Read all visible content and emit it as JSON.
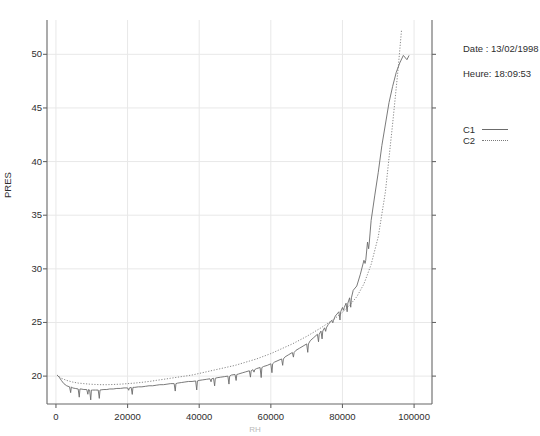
{
  "info": {
    "date_line": "Date : 13/02/1998",
    "time_line": "Heure: 18:09:53"
  },
  "legend": {
    "position": "right",
    "entries": [
      {
        "label": "C1",
        "style": "solid"
      },
      {
        "label": "C2",
        "style": "dotted"
      }
    ]
  },
  "chart_data": {
    "type": "line",
    "title": "",
    "xlabel": "RH",
    "ylabel": "PRES",
    "xlim": [
      -2500,
      105000
    ],
    "ylim": [
      17.4,
      53.2
    ],
    "grid": true,
    "xticks": [
      0,
      20000,
      40000,
      60000,
      80000,
      100000
    ],
    "xtick_labels": [
      "0",
      "20000",
      "40000",
      "60000",
      "80000",
      "100000"
    ],
    "yticks": [
      20,
      25,
      30,
      35,
      40,
      45,
      50
    ],
    "ytick_labels": [
      "20",
      "25",
      "30",
      "35",
      "40",
      "45",
      "50"
    ],
    "series": [
      {
        "name": "C1",
        "style": "solid",
        "color": "#6b6b6b",
        "description": "Noisy stepped trace with frequent downward spikes; starts near 20, dips to ~18.7, slowly climbs, then rises steeply after 85000 ending near 50.",
        "x": [
          300,
          900,
          1500,
          2200,
          3000,
          3800,
          4600,
          5400,
          6200,
          7000,
          7800,
          8600,
          9400,
          10200,
          11000,
          11800,
          12600,
          13400,
          14200,
          15000,
          16000,
          17000,
          18000,
          19000,
          20000,
          21000,
          22000,
          23000,
          24000,
          25000,
          26000,
          27000,
          28000,
          29000,
          30000,
          31000,
          32000,
          33000,
          34000,
          35000,
          36000,
          37000,
          38000,
          39000,
          40000,
          41000,
          42000,
          43000,
          44000,
          45000,
          46000,
          47000,
          48000,
          49000,
          50000,
          51000,
          52000,
          53000,
          54000,
          55000,
          56000,
          57000,
          58000,
          59000,
          60000,
          61000,
          62000,
          63000,
          64000,
          65000,
          66000,
          67000,
          68000,
          69000,
          70000,
          71000,
          72000,
          73000,
          74000,
          75000,
          76000,
          77000,
          78000,
          79000,
          80000,
          81000,
          82000,
          83000,
          84000,
          85000,
          86000,
          87000,
          88000,
          89000,
          90000,
          91000,
          92000,
          93000,
          94000,
          95000,
          96000,
          97000,
          98000,
          98600
        ],
        "y": [
          20.1,
          19.9,
          19.6,
          19.3,
          19.1,
          19.0,
          18.9,
          18.85,
          18.8,
          18.8,
          18.75,
          18.75,
          18.7,
          18.7,
          18.7,
          18.7,
          18.72,
          18.75,
          18.75,
          18.8,
          18.8,
          18.85,
          18.85,
          18.9,
          18.9,
          18.95,
          18.95,
          19.0,
          19.0,
          19.05,
          19.1,
          19.1,
          19.15,
          19.2,
          19.2,
          19.25,
          19.3,
          19.3,
          19.35,
          19.4,
          19.45,
          19.5,
          19.5,
          19.55,
          19.6,
          19.65,
          19.7,
          19.75,
          19.8,
          19.85,
          19.9,
          19.95,
          20.0,
          20.1,
          20.15,
          20.2,
          20.3,
          20.4,
          20.5,
          20.6,
          20.7,
          20.8,
          20.9,
          21.0,
          21.15,
          21.3,
          21.45,
          21.6,
          21.8,
          22.0,
          22.2,
          22.4,
          22.6,
          22.8,
          23.0,
          23.3,
          23.6,
          23.9,
          24.2,
          24.5,
          24.8,
          25.2,
          25.6,
          26.0,
          26.4,
          26.8,
          27.3,
          28.0,
          28.4,
          29.5,
          30.8,
          32.5,
          34.5,
          36.8,
          39.0,
          41.5,
          43.5,
          45.5,
          47.0,
          48.3,
          49.2,
          49.9,
          49.5,
          49.9
        ]
      },
      {
        "name": "C2",
        "style": "dotted",
        "color": "#7a7a7a",
        "description": "Smooth monotone reference curve; starts ~20.1, minimum ~19.2, rises gently and then steeply past 85000, ending near 52.3 at about 96500.",
        "x": [
          300,
          1500,
          3000,
          4600,
          6200,
          7800,
          9400,
          11000,
          12600,
          14200,
          16000,
          18000,
          20000,
          22000,
          24000,
          26000,
          28000,
          30000,
          32000,
          34000,
          36000,
          38000,
          40000,
          42000,
          44000,
          46000,
          48000,
          50000,
          52000,
          54000,
          56000,
          58000,
          60000,
          62000,
          64000,
          66000,
          68000,
          70000,
          72000,
          74000,
          76000,
          78000,
          80000,
          82000,
          84000,
          86000,
          88000,
          90000,
          92000,
          94000,
          95500,
          96500
        ],
        "y": [
          20.1,
          19.8,
          19.6,
          19.45,
          19.35,
          19.3,
          19.25,
          19.22,
          19.2,
          19.2,
          19.22,
          19.25,
          19.3,
          19.35,
          19.42,
          19.5,
          19.6,
          19.7,
          19.8,
          19.9,
          20.0,
          20.1,
          20.25,
          20.4,
          20.55,
          20.7,
          20.85,
          21.0,
          21.2,
          21.4,
          21.6,
          21.85,
          22.1,
          22.4,
          22.7,
          23.0,
          23.35,
          23.7,
          24.1,
          24.5,
          24.95,
          25.4,
          25.95,
          26.6,
          27.4,
          28.6,
          30.4,
          33.0,
          37.2,
          43.5,
          48.5,
          52.3
        ]
      }
    ]
  }
}
